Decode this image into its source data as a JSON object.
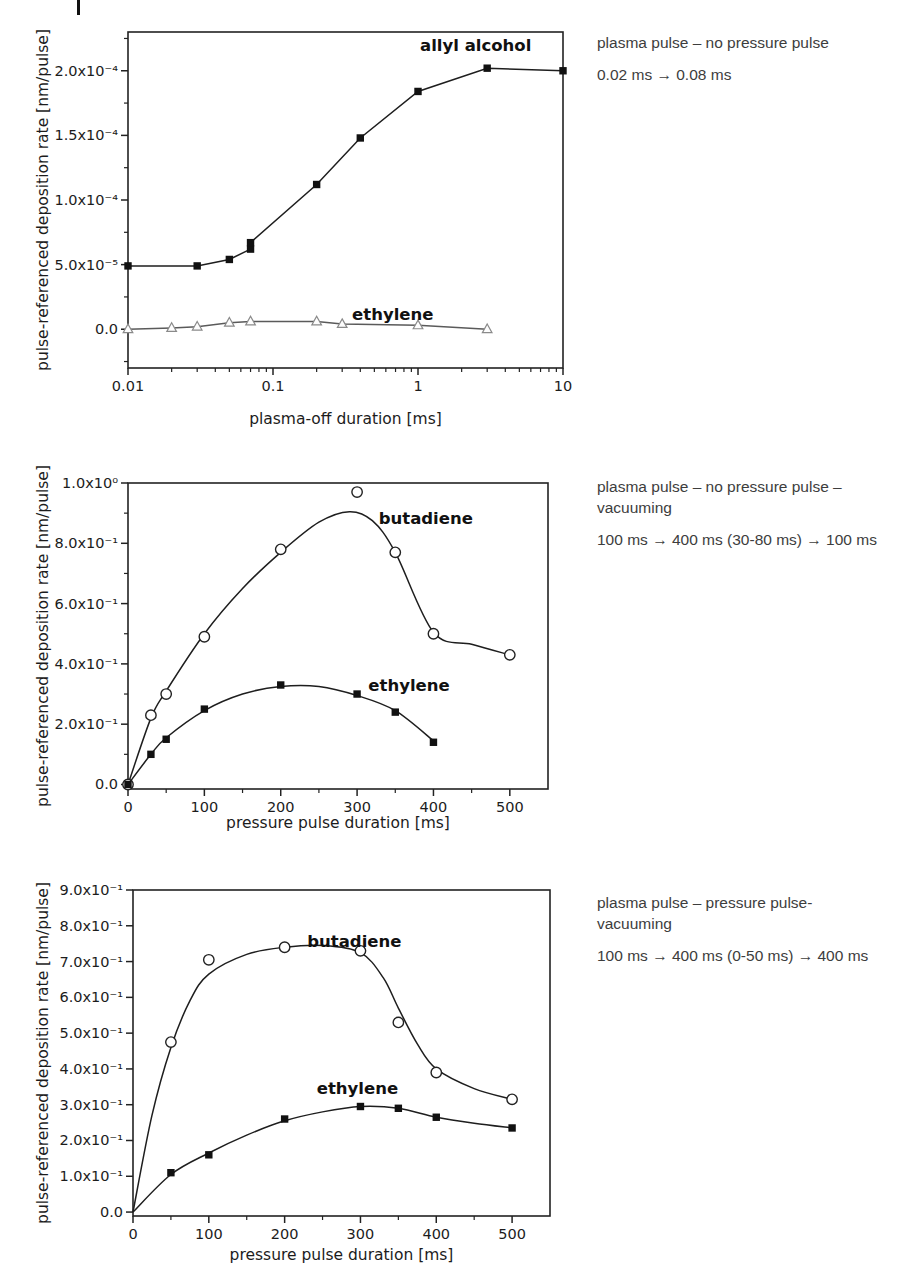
{
  "page": {
    "background": "#ffffff"
  },
  "figure_rows": [
    {
      "annotation": {
        "line1": "plasma pulse – no pressure pulse",
        "line2": "",
        "timing": "0.02 ms → 0.08 ms"
      }
    },
    {
      "annotation": {
        "line1": "plasma pulse – no pressure pulse –",
        "line2": "vacuuming",
        "timing": "100 ms → 400 ms (30-80 ms) → 100 ms"
      }
    },
    {
      "annotation": {
        "line1": "plasma pulse – pressure pulse-",
        "line2": "vacuuming",
        "timing": "100 ms → 400 ms (0-50 ms) → 400 ms"
      }
    }
  ],
  "chart_data": [
    {
      "type": "line",
      "title": "",
      "xlabel": "plasma-off duration [ms]",
      "ylabel": "pulse-referenced deposition rate [nm/pulse]",
      "xscale": "log",
      "xlim": [
        0.01,
        10
      ],
      "ylim": [
        -3e-05,
        0.00023
      ],
      "grid": false,
      "legend_position": "inline-labels",
      "x_ticks": [
        {
          "v": 0.01,
          "label": "0.01"
        },
        {
          "v": 0.1,
          "label": "0.1"
        },
        {
          "v": 1,
          "label": "1"
        },
        {
          "v": 10,
          "label": "10"
        }
      ],
      "x_minor_ticks": [
        0.02,
        0.03,
        0.04,
        0.05,
        0.06,
        0.07,
        0.08,
        0.09,
        0.2,
        0.3,
        0.4,
        0.5,
        0.6,
        0.7,
        0.8,
        0.9,
        2,
        3,
        4,
        5,
        6,
        7,
        8,
        9
      ],
      "y_ticks": [
        {
          "v": 0,
          "label": "0.0"
        },
        {
          "v": 5e-05,
          "label": "5.0x10⁻⁵"
        },
        {
          "v": 0.0001,
          "label": "1.0x10⁻⁴"
        },
        {
          "v": 0.00015,
          "label": "1.5x10⁻⁴"
        },
        {
          "v": 0.0002,
          "label": "2.0x10⁻⁴"
        }
      ],
      "y_minor_ticks": [
        -2.5e-05,
        2.5e-05,
        7.5e-05,
        0.000125,
        0.000175,
        0.000225
      ],
      "series": [
        {
          "name": "allyl alcohol",
          "marker": "square-filled",
          "color": "#1e1e1e",
          "line": "straight",
          "label": {
            "text": "allyl alcohol",
            "x": 2.5,
            "y": 0.000219
          },
          "points": [
            [
              0.01,
              4.9e-05
            ],
            [
              0.03,
              4.9e-05
            ],
            [
              0.05,
              5.4e-05
            ],
            [
              0.07,
              6.2e-05
            ],
            [
              0.07,
              6.7e-05
            ],
            [
              0.2,
              0.000112
            ],
            [
              0.4,
              0.000148
            ],
            [
              1,
              0.000184
            ],
            [
              3,
              0.000202
            ],
            [
              10,
              0.0002
            ]
          ]
        },
        {
          "name": "ethylene",
          "marker": "triangle-open",
          "color": "#5a5a5a",
          "marker_color": "#8a8a8a",
          "line": "straight",
          "label": {
            "text": "ethylene",
            "x": 0.67,
            "y": 1.1e-05
          },
          "points": [
            [
              0.01,
              0
            ],
            [
              0.02,
              1e-06
            ],
            [
              0.03,
              2e-06
            ],
            [
              0.05,
              5e-06
            ],
            [
              0.07,
              6e-06
            ],
            [
              0.2,
              6e-06
            ],
            [
              0.3,
              4e-06
            ],
            [
              1,
              3e-06
            ],
            [
              3,
              0
            ]
          ]
        }
      ]
    },
    {
      "type": "line",
      "title": "",
      "xlabel": "pressure pulse duration [ms]",
      "ylabel": "pulse-referenced deposition rate [nm/pulse]",
      "xscale": "linear",
      "xlim": [
        0,
        550
      ],
      "ylim": [
        -0.015,
        1.0
      ],
      "grid": false,
      "legend_position": "inline-labels",
      "x_ticks": [
        {
          "v": 0,
          "label": "0"
        },
        {
          "v": 100,
          "label": "100"
        },
        {
          "v": 200,
          "label": "200"
        },
        {
          "v": 300,
          "label": "300"
        },
        {
          "v": 400,
          "label": "400"
        },
        {
          "v": 500,
          "label": "500"
        }
      ],
      "x_minor_ticks": [
        50,
        150,
        250,
        350,
        450
      ],
      "y_ticks": [
        {
          "v": 0,
          "label": "0.0"
        },
        {
          "v": 0.2,
          "label": "2.0x10⁻¹"
        },
        {
          "v": 0.4,
          "label": "4.0x10⁻¹"
        },
        {
          "v": 0.6,
          "label": "6.0x10⁻¹"
        },
        {
          "v": 0.8,
          "label": "8.0x10⁻¹"
        },
        {
          "v": 1.0,
          "label": "1.0x10⁰"
        }
      ],
      "y_minor_ticks": [
        0.1,
        0.3,
        0.5,
        0.7,
        0.9
      ],
      "series": [
        {
          "name": "butadiene",
          "marker": "circle-open",
          "color": "#1e1e1e",
          "line": "smooth",
          "label": {
            "text": "butadiene",
            "x": 390,
            "y": 0.88
          },
          "points": [
            [
              0,
              0
            ],
            [
              30,
              0.23
            ],
            [
              50,
              0.3
            ],
            [
              100,
              0.49
            ],
            [
              200,
              0.78
            ],
            [
              300,
              0.97
            ],
            [
              350,
              0.77
            ],
            [
              400,
              0.5
            ],
            [
              500,
              0.43
            ]
          ],
          "fit_curve": [
            [
              0,
              0
            ],
            [
              30,
              0.22
            ],
            [
              50,
              0.31
            ],
            [
              100,
              0.5
            ],
            [
              150,
              0.65
            ],
            [
              200,
              0.77
            ],
            [
              250,
              0.87
            ],
            [
              290,
              0.905
            ],
            [
              320,
              0.875
            ],
            [
              350,
              0.77
            ],
            [
              400,
              0.505
            ],
            [
              450,
              0.465
            ],
            [
              500,
              0.43
            ]
          ]
        },
        {
          "name": "ethylene",
          "marker": "square-filled",
          "color": "#1e1e1e",
          "line": "smooth",
          "label": {
            "text": "ethylene",
            "x": 368,
            "y": 0.325
          },
          "points": [
            [
              0,
              0
            ],
            [
              30,
              0.1
            ],
            [
              50,
              0.15
            ],
            [
              100,
              0.25
            ],
            [
              200,
              0.33
            ],
            [
              300,
              0.3
            ],
            [
              350,
              0.24
            ],
            [
              400,
              0.14
            ]
          ],
          "fit_curve": [
            [
              0,
              0
            ],
            [
              30,
              0.1
            ],
            [
              50,
              0.155
            ],
            [
              100,
              0.245
            ],
            [
              150,
              0.3
            ],
            [
              200,
              0.325
            ],
            [
              250,
              0.325
            ],
            [
              300,
              0.295
            ],
            [
              350,
              0.245
            ],
            [
              400,
              0.145
            ]
          ]
        }
      ]
    },
    {
      "type": "line",
      "title": "",
      "xlabel": "pressure pulse duration [ms]",
      "ylabel": "pulse-referenced deposition rate [nm/pulse]",
      "xscale": "linear",
      "xlim": [
        0,
        550
      ],
      "ylim": [
        -0.011,
        0.9
      ],
      "grid": false,
      "legend_position": "inline-labels",
      "x_ticks": [
        {
          "v": 0,
          "label": "0"
        },
        {
          "v": 100,
          "label": "100"
        },
        {
          "v": 200,
          "label": "200"
        },
        {
          "v": 300,
          "label": "300"
        },
        {
          "v": 400,
          "label": "400"
        },
        {
          "v": 500,
          "label": "500"
        }
      ],
      "x_minor_ticks": [
        50,
        150,
        250,
        350,
        450
      ],
      "y_ticks": [
        {
          "v": 0,
          "label": "0.0"
        },
        {
          "v": 0.1,
          "label": "1.0x10⁻¹"
        },
        {
          "v": 0.2,
          "label": "2.0x10⁻¹"
        },
        {
          "v": 0.3,
          "label": "3.0x10⁻¹"
        },
        {
          "v": 0.4,
          "label": "4.0x10⁻¹"
        },
        {
          "v": 0.5,
          "label": "5.0x10⁻¹"
        },
        {
          "v": 0.6,
          "label": "6.0x10⁻¹"
        },
        {
          "v": 0.7,
          "label": "7.0x10⁻¹"
        },
        {
          "v": 0.8,
          "label": "8.0x10⁻¹"
        },
        {
          "v": 0.9,
          "label": "9.0x10⁻¹"
        }
      ],
      "y_minor_ticks": [],
      "series": [
        {
          "name": "butadiene",
          "marker": "circle-open",
          "color": "#1e1e1e",
          "line": "smooth",
          "label": {
            "text": "butadiene",
            "x": 292,
            "y": 0.755
          },
          "points": [
            [
              50,
              0.475
            ],
            [
              100,
              0.705
            ],
            [
              200,
              0.74
            ],
            [
              300,
              0.73
            ],
            [
              350,
              0.53
            ],
            [
              400,
              0.39
            ],
            [
              500,
              0.315
            ]
          ],
          "fit_curve": [
            [
              0,
              0
            ],
            [
              25,
              0.27
            ],
            [
              50,
              0.46
            ],
            [
              75,
              0.59
            ],
            [
              100,
              0.665
            ],
            [
              150,
              0.72
            ],
            [
              200,
              0.74
            ],
            [
              250,
              0.745
            ],
            [
              300,
              0.725
            ],
            [
              330,
              0.655
            ],
            [
              350,
              0.57
            ],
            [
              375,
              0.47
            ],
            [
              400,
              0.4
            ],
            [
              450,
              0.345
            ],
            [
              500,
              0.315
            ]
          ]
        },
        {
          "name": "ethylene",
          "marker": "square-filled",
          "color": "#1e1e1e",
          "line": "smooth",
          "label": {
            "text": "ethylene",
            "x": 296,
            "y": 0.345
          },
          "points": [
            [
              50,
              0.11
            ],
            [
              100,
              0.16
            ],
            [
              200,
              0.26
            ],
            [
              300,
              0.295
            ],
            [
              350,
              0.29
            ],
            [
              400,
              0.265
            ],
            [
              500,
              0.235
            ]
          ],
          "fit_curve": [
            [
              0,
              0
            ],
            [
              50,
              0.105
            ],
            [
              100,
              0.165
            ],
            [
              150,
              0.215
            ],
            [
              200,
              0.255
            ],
            [
              250,
              0.28
            ],
            [
              300,
              0.295
            ],
            [
              350,
              0.29
            ],
            [
              400,
              0.265
            ],
            [
              450,
              0.248
            ],
            [
              500,
              0.235
            ]
          ]
        }
      ]
    }
  ]
}
